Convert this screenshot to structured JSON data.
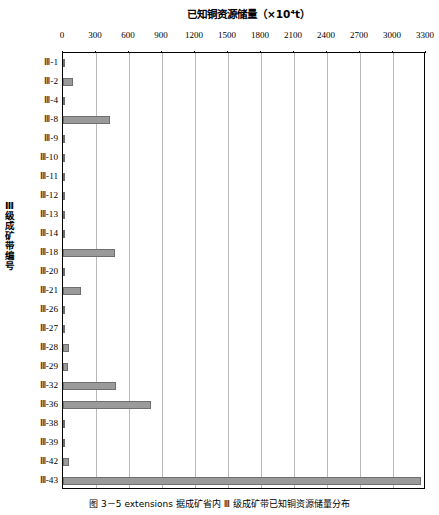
{
  "figure": {
    "caption": "图 3－5  extensions 据成矿省内 Ⅲ 级成矿带已知铜资源储量分布",
    "yaxis_title": "Ⅲ级成矿带编号",
    "bar_color": "#9a9a9a",
    "bar_border_color": "#6f6f6f",
    "gridline_color": "#b9b9b9",
    "axis_color": "#000000"
  },
  "chart_data": {
    "type": "bar",
    "orientation": "horizontal",
    "title": "已知铜资源储量（×10⁴t）",
    "xlabel": "已知铜资源储量（×10⁴t）",
    "ylabel": "Ⅲ级成矿带编号",
    "xlim": [
      0,
      3300
    ],
    "ylim": null,
    "grid": true,
    "legend": null,
    "xticks": [
      0,
      300,
      600,
      900,
      1200,
      1500,
      1800,
      2100,
      2400,
      2700,
      3000,
      3300
    ],
    "categories": [
      "Ⅲ-1",
      "Ⅲ-2",
      "Ⅲ-4",
      "Ⅲ-8",
      "Ⅲ-9",
      "Ⅲ-10",
      "Ⅲ-11",
      "Ⅲ-12",
      "Ⅲ-13",
      "Ⅲ-14",
      "Ⅲ-18",
      "Ⅲ-20",
      "Ⅲ-21",
      "Ⅲ-26",
      "Ⅲ-27",
      "Ⅲ-28",
      "Ⅲ-29",
      "Ⅲ-32",
      "Ⅲ-36",
      "Ⅲ-38",
      "Ⅲ-39",
      "Ⅲ-42",
      "Ⅲ-43"
    ],
    "values": [
      12,
      95,
      10,
      430,
      14,
      6,
      6,
      6,
      6,
      12,
      470,
      8,
      160,
      6,
      6,
      50,
      45,
      480,
      800,
      10,
      18,
      55,
      3250
    ]
  }
}
